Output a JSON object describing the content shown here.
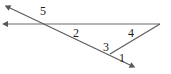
{
  "figure": {
    "type": "geometry-diagram",
    "background_color": "#ffffff",
    "line_color": "#595959",
    "label_color": "#1a1a1a",
    "width": 171,
    "height": 74,
    "points": {
      "horizontal_arrow_tip": {
        "x": 8,
        "y": 24
      },
      "transversal_arrow_tip": {
        "x": 10,
        "y": 8
      },
      "top_intersection": {
        "x": 48,
        "y": 24
      },
      "right_vertex": {
        "x": 160,
        "y": 24
      },
      "bottom_vertex": {
        "x": 110,
        "y": 54
      },
      "transversal_arrow_tail": {
        "x": 130,
        "y": 65
      }
    },
    "lines": [
      {
        "name": "horizontal-ray",
        "from": "horizontal_arrow_tip",
        "to": "right_vertex",
        "arrow_start": true,
        "arrow_end": false
      },
      {
        "name": "transversal-ray",
        "from": "transversal_arrow_tip",
        "to": "transversal_arrow_tail",
        "arrow_start": true,
        "arrow_end": true
      },
      {
        "name": "closing-segment",
        "from": "right_vertex",
        "to": "bottom_vertex",
        "arrow_start": false,
        "arrow_end": false
      }
    ],
    "angle_labels": [
      {
        "id": "angle-5",
        "text": "5",
        "x": 43,
        "y": 11
      },
      {
        "id": "angle-2",
        "text": "2",
        "x": 76,
        "y": 33
      },
      {
        "id": "angle-4",
        "text": "4",
        "x": 131,
        "y": 33
      },
      {
        "id": "angle-3",
        "text": "3",
        "x": 106,
        "y": 47
      },
      {
        "id": "angle-1",
        "text": "1",
        "x": 122,
        "y": 58
      }
    ]
  }
}
